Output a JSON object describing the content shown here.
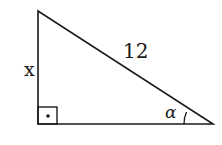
{
  "diagram": {
    "type": "right-triangle",
    "stroke_color": "#1a1a1a",
    "vertices": {
      "top": [
        38,
        11
      ],
      "right_angle": [
        38,
        124
      ],
      "acute": [
        213,
        124
      ]
    },
    "labels": {
      "vertical_leg": "x",
      "hypotenuse": "12",
      "angle": "α"
    },
    "right_angle_marker": "square-with-dot",
    "angle_marker": "arc-at-acute-vertex"
  }
}
